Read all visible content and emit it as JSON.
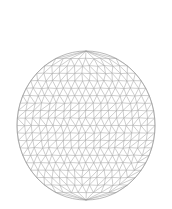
{
  "figure": {
    "type": "triangular-mesh",
    "shape": "disk",
    "width": 172,
    "height": 209,
    "background": "#ffffff",
    "center": {
      "x": 86,
      "y": 125.5
    },
    "radius": {
      "x": 69,
      "y": 74.5
    },
    "rows": 20,
    "line_color": "#a6a6a6",
    "boundary_color": "#9a9a9a",
    "line_width": 0.55
  }
}
